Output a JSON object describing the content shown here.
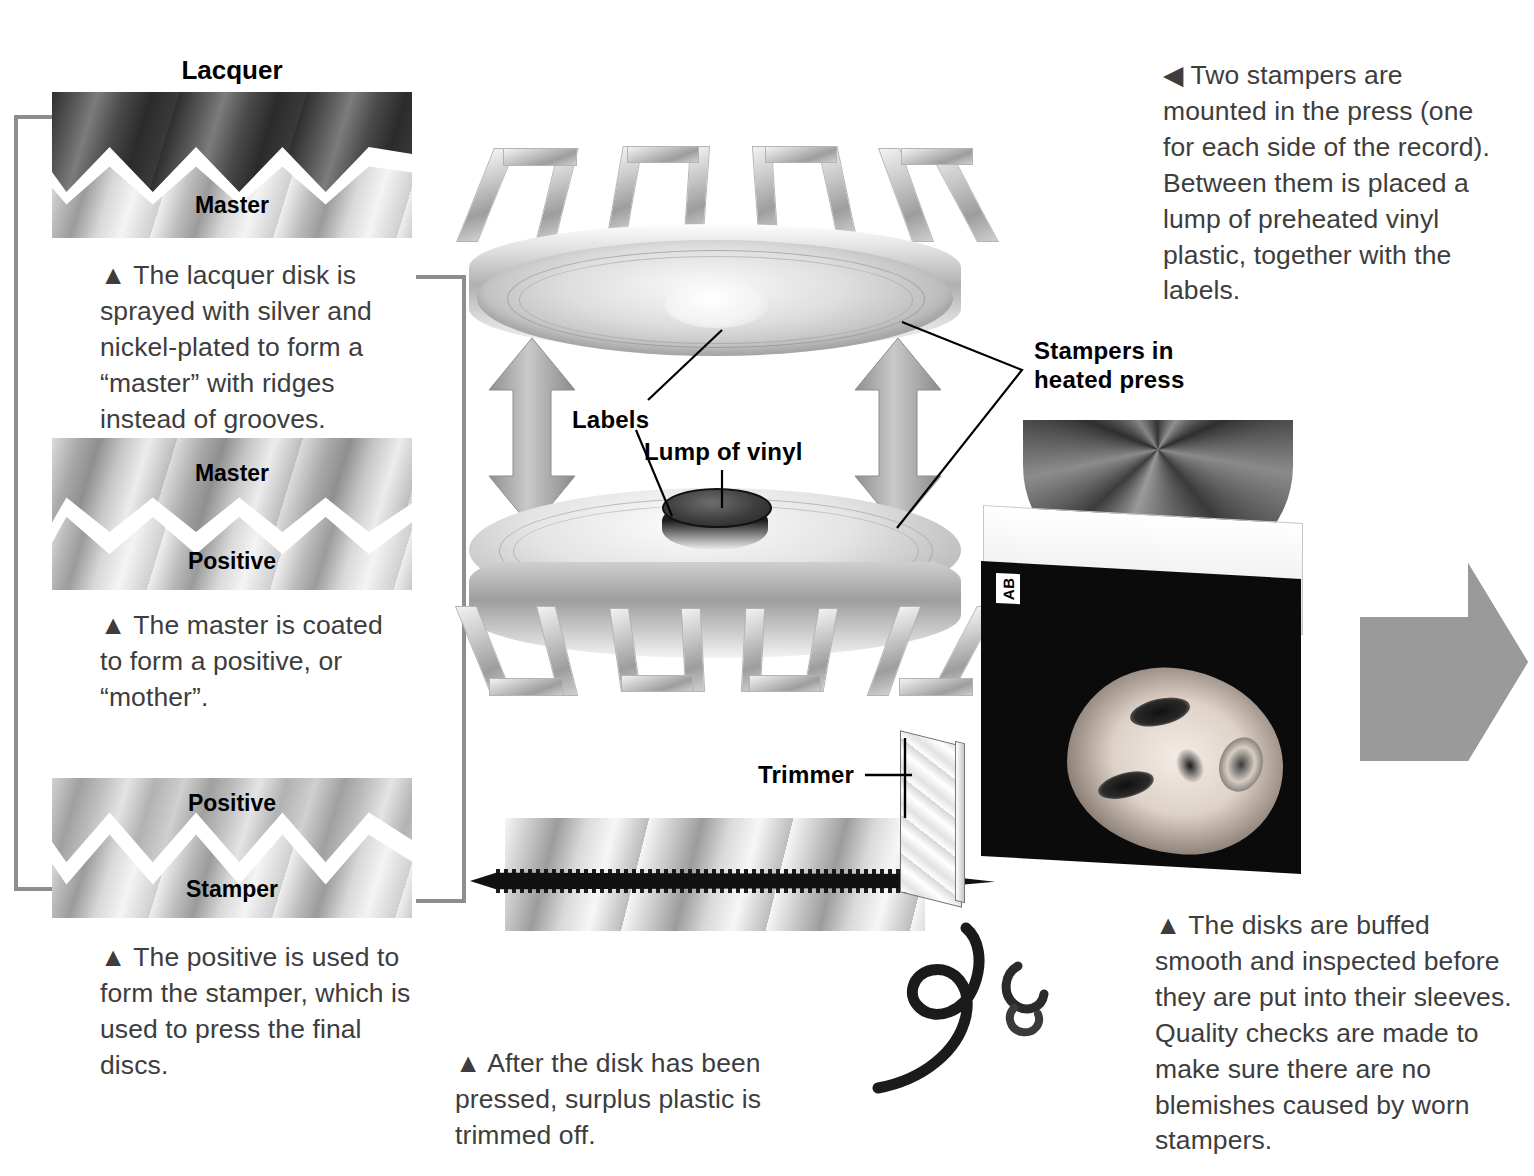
{
  "panels": [
    {
      "id": "lacquer-master",
      "heading": "Lacquer",
      "top_layer_label": "",
      "bottom_layer_label": "Master",
      "caption": "▲ The lacquer disk is sprayed with silver and nickel-plated to form a “master” with ridges instead of grooves."
    },
    {
      "id": "master-positive",
      "heading": "",
      "top_layer_label": "Master",
      "bottom_layer_label": "Positive",
      "caption": "▲ The master is coated to form a positive, or “mother”."
    },
    {
      "id": "positive-stamper",
      "heading": "",
      "top_layer_label": "Positive",
      "bottom_layer_label": "Stamper",
      "caption": "▲ The positive is used to form the stamper, which is used to press the final discs."
    }
  ],
  "press": {
    "intro_caption": "◀ Two stampers are mounted in the press (one for each side of the record). Between them is placed a lump of preheated vinyl plastic, together with the labels.",
    "labels": {
      "labels": "Labels",
      "lump_of_vinyl": "Lump of vinyl",
      "stampers_in_heated_press": "Stampers in\nheated press"
    }
  },
  "trim": {
    "label": "Trimmer",
    "caption": "▲ After the disk has been pressed, surplus plastic is trimmed off."
  },
  "finish": {
    "sleeve_badge": "AB",
    "caption": "▲ The disks are buffed smooth and inspected before they are put into their sleeves. Quality checks are made to make sure there are no blemishes caused by worn stampers."
  },
  "colors": {
    "connector_grey": "#8e8e90",
    "arrow_grey": "#9a9a9a",
    "text_grey": "#3d3d3d",
    "ink_black": "#000000"
  }
}
